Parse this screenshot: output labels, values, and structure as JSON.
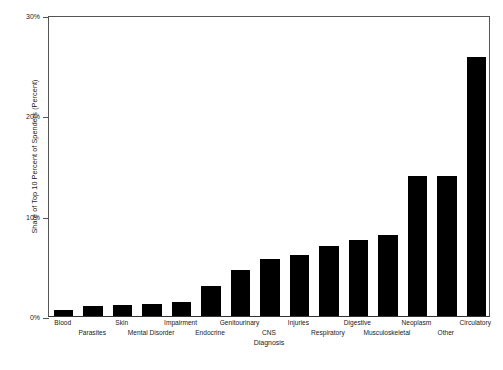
{
  "chart_data": {
    "type": "bar",
    "title": "",
    "xlabel": "Diagnosis",
    "ylabel": "Share of Top 10 Percent of Spenders (Percent)",
    "ylim": [
      0,
      30
    ],
    "yticks": [
      0,
      10,
      20,
      30
    ],
    "ytick_labels": [
      "0%",
      "10%",
      "20%",
      "30%"
    ],
    "grid": false,
    "legend": null,
    "bar_color": "#000000",
    "categories": [
      "Blood",
      "Parasites",
      "Skin",
      "Mental Disorder",
      "Impairment",
      "Endocrine",
      "Genitourinary",
      "CNS",
      "Injuries",
      "Respiratory",
      "Digestive",
      "Musculoskeletal",
      "Neoplasm",
      "Other",
      "Circulatory"
    ],
    "values": [
      0.6,
      1.0,
      1.1,
      1.2,
      1.4,
      3.0,
      4.6,
      5.7,
      6.1,
      7.0,
      7.6,
      8.1,
      14.0,
      14.0,
      25.8
    ]
  },
  "axis": {
    "y_title": "Share of Top 10 Percent of Spenders (Percent)",
    "x_title": "Diagnosis",
    "tick_0": "0%",
    "tick_10": "10%",
    "tick_20": "20%",
    "tick_30": "30%"
  }
}
